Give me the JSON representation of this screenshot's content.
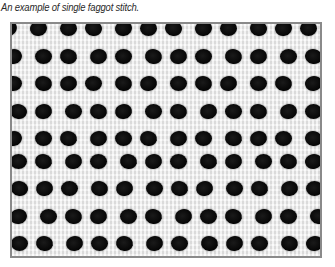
{
  "caption": "An example of single faggot stitch.",
  "photo": {
    "subject": "single faggot stitch fabric closeup",
    "frame_color": "#8a8a8a",
    "hole_color": "#0a0a0a",
    "fabric_color": "#ececec",
    "grid": {
      "cols": 12,
      "rows": 9,
      "dx": 27,
      "dy": 26.5,
      "x0": 4,
      "y0": 0
    }
  }
}
